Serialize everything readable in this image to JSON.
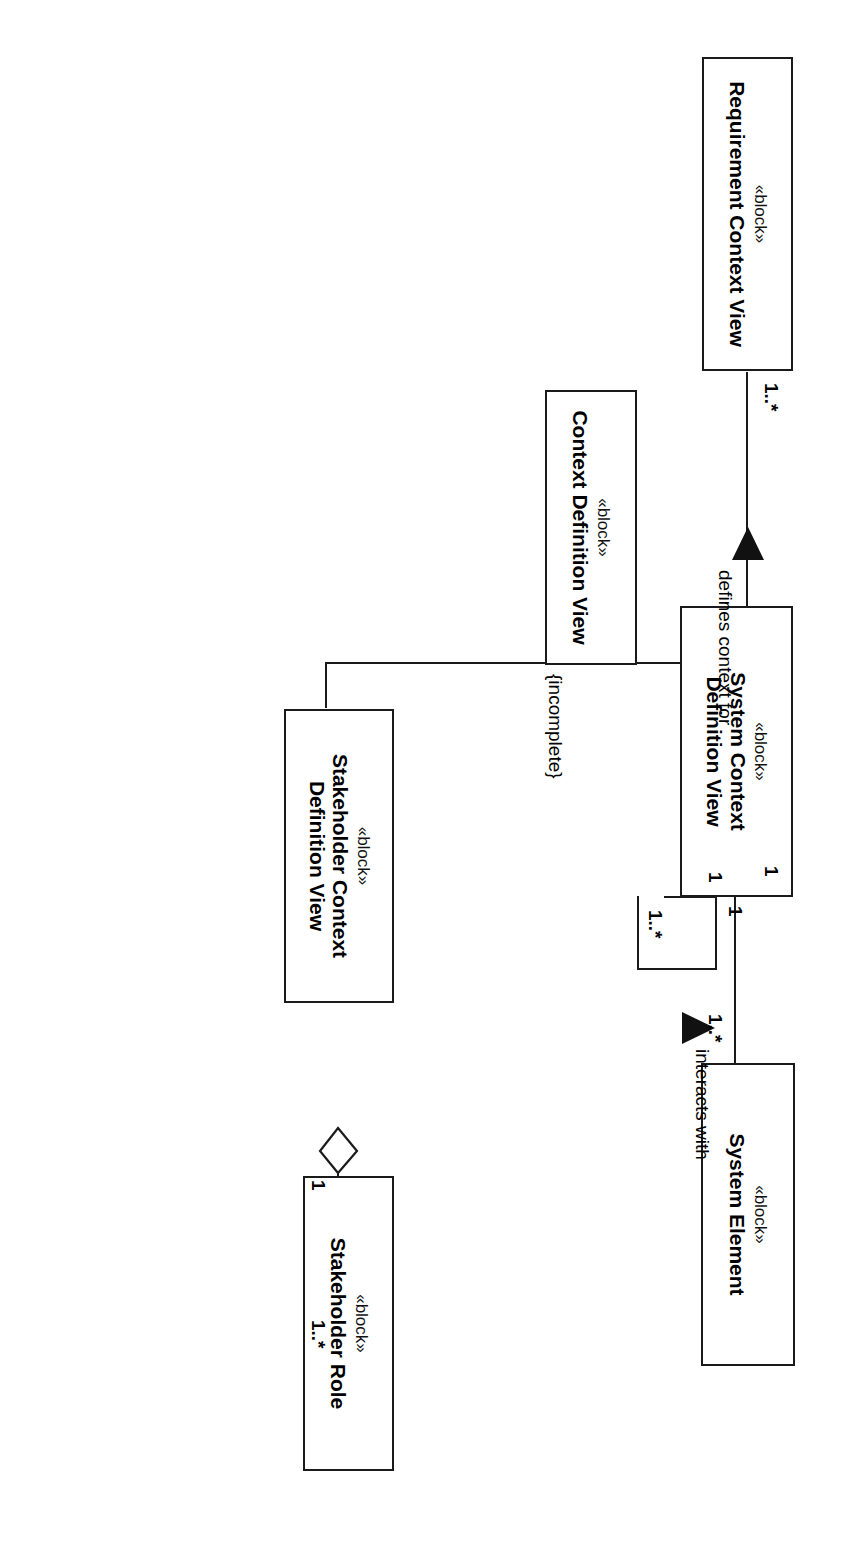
{
  "diagram": {
    "type": "sysml-block-definition-diagram",
    "orientation": "rotated-90-clockwise",
    "stereotype": "«block»",
    "blocks": [
      {
        "id": "requirement_context_view",
        "stereotype": "«block»",
        "name": "Requirement Context View"
      },
      {
        "id": "context_definition_view",
        "stereotype": "«block»",
        "name": "Context Definition View"
      },
      {
        "id": "system_context_definition_view",
        "stereotype": "«block»",
        "name": "System Context\nDefinition View",
        "line1": "System Context",
        "line2": "Definition View"
      },
      {
        "id": "system_element",
        "stereotype": "«block»",
        "name": "System Element"
      },
      {
        "id": "stakeholder_context_definition_view",
        "stereotype": "«block»",
        "name": "Stakeholder Context\nDefinition View",
        "line1": "Stakeholder Context",
        "line2": "Definition View"
      },
      {
        "id": "stakeholder_role",
        "stereotype": "«block»",
        "name": "Stakeholder Role"
      }
    ],
    "relationships": [
      {
        "id": "defines_context_for",
        "kind": "association",
        "label": "defines context for",
        "source": "context_definition_view",
        "source_multiplicity": "1",
        "target": "requirement_context_view",
        "target_multiplicity": "1..*",
        "direction_marker": "solid-triangle"
      },
      {
        "id": "generalization_set",
        "kind": "generalization",
        "parent": "context_definition_view",
        "children": [
          "system_context_definition_view",
          "stakeholder_context_definition_view"
        ],
        "constraint": "{incomplete}"
      },
      {
        "id": "system_context_aggregates_system_element",
        "kind": "aggregation",
        "whole": "system_context_definition_view",
        "whole_multiplicity": "1",
        "part": "system_element",
        "part_multiplicity": "1..*"
      },
      {
        "id": "stakeholder_context_aggregates_stakeholder_role",
        "kind": "aggregation",
        "whole": "stakeholder_context_definition_view",
        "whole_multiplicity": "1",
        "part": "stakeholder_role",
        "part_multiplicity": "1..*"
      },
      {
        "id": "system_element_interacts_with",
        "kind": "association",
        "label": "interacts with",
        "source": "system_element",
        "source_multiplicity": "1",
        "target": "system_element",
        "target_multiplicity": "1..*",
        "direction_marker": "solid-triangle",
        "self_loop": true
      }
    ],
    "colors": {
      "stroke": "#1a1a1a",
      "fill": "#ffffff",
      "text": "#000000"
    }
  }
}
